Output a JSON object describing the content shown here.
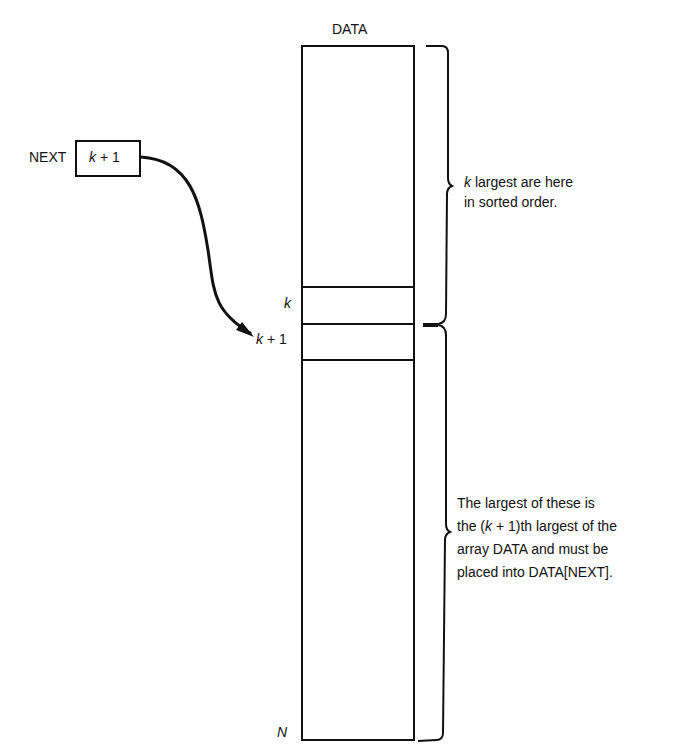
{
  "diagram": {
    "array_label": "DATA",
    "pointer": {
      "name_label": "NEXT",
      "value_label": "k + 1"
    },
    "row_labels": {
      "k": "k",
      "k_plus_1": "k + 1",
      "n": "N"
    },
    "upper_bracket_note": {
      "line1_var": "k",
      "line1_rest": " largest are here",
      "line2": "in sorted order."
    },
    "lower_bracket_note": {
      "line1": "The largest of these is",
      "line2_pre": "the (",
      "line2_var": "k",
      "line2_post": " + 1)th largest of the",
      "line3": "array DATA and must be",
      "line4": "placed into DATA[NEXT]."
    },
    "colors": {
      "ink": "#111111",
      "background": "#ffffff"
    }
  }
}
